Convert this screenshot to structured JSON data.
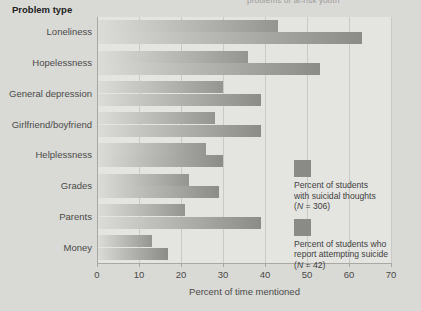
{
  "top_cropped_text": "problems of at-risk youth",
  "axis_title_y": "Problem type",
  "axis_title_x": "Percent of time mentioned",
  "legend": [
    {
      "swatch_name": "legend-swatch-suicidal-thoughts",
      "line1": "Percent of students",
      "line2": "with suicidal thoughts",
      "line3_prefix": "(",
      "line3_italic": "N",
      "line3_suffix": " = 306)"
    },
    {
      "swatch_name": "legend-swatch-attempted-suicide",
      "line1": "Percent of students who",
      "line2": "report attempting suicide",
      "line3_prefix": "(",
      "line3_italic": "N",
      "line3_suffix": " = 42)"
    }
  ],
  "chart_data": {
    "type": "bar",
    "orientation": "horizontal",
    "title": "",
    "xlabel": "Percent of time mentioned",
    "ylabel": "Problem type",
    "xlim": [
      0,
      70
    ],
    "xticks": [
      0,
      10,
      20,
      30,
      40,
      50,
      60,
      70
    ],
    "grid": "vertical",
    "legend_position": "right",
    "categories": [
      "Loneliness",
      "Hopelessness",
      "General depression",
      "Girlfriend/boyfriend",
      "Helplessness",
      "Grades",
      "Parents",
      "Money"
    ],
    "series": [
      {
        "name": "Percent of students with suicidal thoughts (N = 306)",
        "values": [
          43,
          36,
          30,
          28,
          26,
          22,
          21,
          13
        ]
      },
      {
        "name": "Percent of students who report attempting suicide (N = 42)",
        "values": [
          63,
          53,
          39,
          39,
          30,
          29,
          39,
          17
        ]
      }
    ]
  }
}
